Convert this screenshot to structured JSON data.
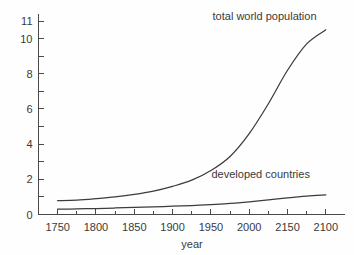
{
  "chart_data": {
    "type": "line",
    "title": "",
    "xlabel": "year",
    "ylabel": "",
    "xlim": [
      1725,
      2125
    ],
    "ylim": [
      0,
      11.4
    ],
    "grid": false,
    "legend_position": "inline-annotations",
    "x_ticks_major": [
      1750,
      1800,
      1850,
      1900,
      1950,
      2000,
      2150,
      2100
    ],
    "x_tick_labels": [
      "1750",
      "1800",
      "1850",
      "1900",
      "1950",
      "2000",
      "2150",
      "2100"
    ],
    "x_ticks_minor": [
      1775,
      1825,
      1875,
      1925,
      1975,
      2025,
      2075
    ],
    "y_ticks_major": [
      0,
      2,
      4,
      6,
      8,
      10,
      11
    ],
    "y_tick_labels": [
      "0",
      "2",
      "4",
      "6",
      "8",
      "10",
      "11"
    ],
    "y_ticks_minor": [
      1,
      3,
      5,
      7,
      9
    ],
    "x": [
      1750,
      1775,
      1800,
      1825,
      1850,
      1875,
      1900,
      1925,
      1950,
      1975,
      2000,
      2025,
      2050,
      2075,
      2100
    ],
    "series": [
      {
        "name": "total world population",
        "label": "total world population",
        "values": [
          0.79,
          0.82,
          0.9,
          1.0,
          1.14,
          1.33,
          1.6,
          1.95,
          2.5,
          3.3,
          4.6,
          6.3,
          8.2,
          9.7,
          10.5
        ]
      },
      {
        "name": "developed countries",
        "label": "developed countries",
        "values": [
          0.3,
          0.32,
          0.34,
          0.37,
          0.4,
          0.43,
          0.47,
          0.51,
          0.56,
          0.63,
          0.72,
          0.83,
          0.95,
          1.05,
          1.12
        ]
      }
    ],
    "annotations": [
      {
        "text": "total world population",
        "x": 2020,
        "y": 11.05
      },
      {
        "text": "developed countries",
        "x": 2015,
        "y": 2.05
      }
    ],
    "colors": {
      "curve": "#3c3c3c",
      "axis": "#4a4a4a",
      "text": "#3a3a3a",
      "background": "#fefefe"
    }
  }
}
